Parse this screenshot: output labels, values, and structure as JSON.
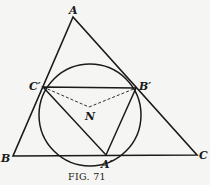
{
  "figure": {
    "caption": "Fig. 71",
    "caption_display": "FIG. 71",
    "colors": {
      "ink": "#1a1a1a",
      "paper": "#f5f5f3"
    },
    "points": {
      "A": {
        "label": "A",
        "x": 73,
        "y": 17
      },
      "B": {
        "label": "B",
        "x": 13,
        "y": 156
      },
      "C": {
        "label": "C",
        "x": 197,
        "y": 155
      },
      "A_prime": {
        "label": "A′",
        "x": 106,
        "y": 155
      },
      "B_prime": {
        "label": "B′",
        "x": 136,
        "y": 88
      },
      "C_prime": {
        "label": "C′",
        "x": 43,
        "y": 87
      },
      "N": {
        "label": "N",
        "x": 89,
        "y": 107
      }
    },
    "circle": {
      "cx": 90,
      "cy": 115,
      "r": 51,
      "description": "circle through A′, B′, C′ (nine-point circle) centered at N"
    },
    "segments_solid": [
      "AB",
      "BC",
      "CA",
      "C′B′",
      "B′A′",
      "A′C′"
    ],
    "segments_dashed": [
      "C′N",
      "NB′"
    ]
  }
}
